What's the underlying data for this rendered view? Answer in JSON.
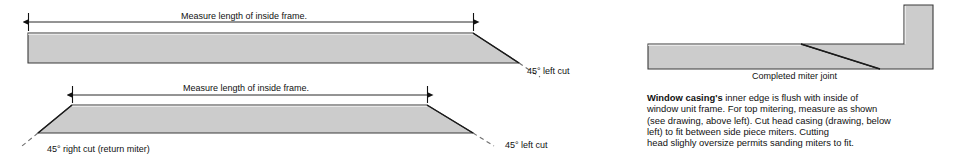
{
  "figure": {
    "background_color": "#ffffff",
    "board_fill": "#cccccc",
    "board_stroke": "#3a3a3a",
    "line_color": "#111111",
    "text_color": "#111111"
  },
  "top_diagram": {
    "dimension_label": "Measure length of inside frame.",
    "cut_label_right": "45° left cut"
  },
  "bottom_diagram": {
    "dimension_label": "Measure length of inside frame.",
    "cut_label_left": "45° right cut (return miter)",
    "cut_label_right": "45° left cut"
  },
  "joint_diagram": {
    "caption": "Completed miter joint"
  },
  "note": {
    "lead_bold": "Window casing's",
    "lines": [
      " inner edge is flush with inside of",
      "window unit frame. For top mitering, measure as shown",
      "(see drawing, above left). Cut head casing (drawing, below",
      "left) to fit between side piece miters. Cutting",
      "head slighly oversize permits sanding miters to fit."
    ]
  }
}
